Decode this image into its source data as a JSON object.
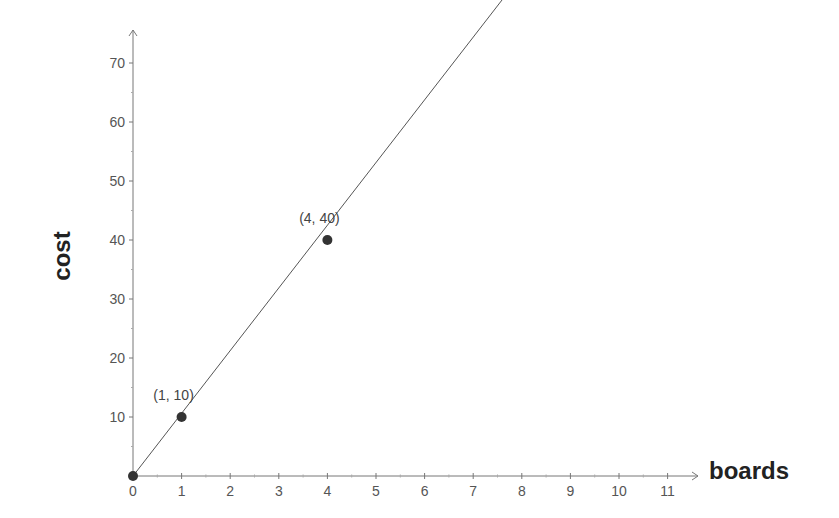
{
  "chart_data": {
    "type": "line",
    "title": "",
    "xlabel": "boards",
    "ylabel": "cost",
    "xlim": [
      0,
      11.5
    ],
    "ylim": [
      0,
      75
    ],
    "x_ticks": [
      0,
      1,
      2,
      3,
      4,
      5,
      6,
      7,
      8,
      9,
      10,
      11
    ],
    "y_ticks": [
      10,
      20,
      30,
      40,
      50,
      60,
      70
    ],
    "grid": false,
    "legend": null,
    "series": [
      {
        "name": "cost = 10 × boards",
        "x": [
          0,
          7.6
        ],
        "y": [
          0,
          76
        ],
        "slope": 10
      }
    ],
    "points": [
      {
        "x": 0,
        "y": 0,
        "label": ""
      },
      {
        "x": 1,
        "y": 10,
        "label": "(1, 10)"
      },
      {
        "x": 4,
        "y": 40,
        "label": "(4, 40)"
      }
    ]
  },
  "colors": {
    "axis": "#777777",
    "line": "#555555",
    "point": "#333333"
  }
}
